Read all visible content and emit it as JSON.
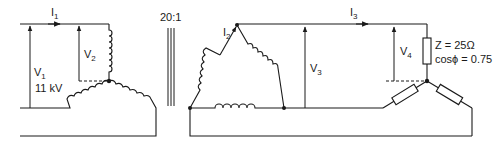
{
  "diagram": {
    "type": "three-phase transformer circuit (star-delta supply with star-connected load)",
    "transformer_ratio": "20:1",
    "primary": {
      "current_label": "I",
      "current_sub": "1",
      "line_voltage_label": "V",
      "line_voltage_sub": "1",
      "line_voltage_value": "11 kV",
      "phase_voltage_label": "V",
      "phase_voltage_sub": "2",
      "connection": "star"
    },
    "secondary": {
      "current_label": "I",
      "current_sub": "2",
      "connection": "delta",
      "line_voltage_label": "V",
      "line_voltage_sub": "3"
    },
    "load": {
      "current_label": "I",
      "current_sub": "3",
      "phase_voltage_label": "V",
      "phase_voltage_sub": "4",
      "impedance": "Z = 25Ω",
      "power_factor": "cosϕ = 0.75",
      "connection": "star"
    },
    "colors": {
      "line": "#1a1a1a",
      "background": "#ffffff"
    }
  }
}
